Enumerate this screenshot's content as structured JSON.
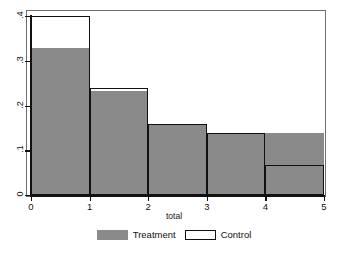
{
  "chart_data": {
    "type": "bar",
    "title": "",
    "subtitle": "",
    "xlabel": "total",
    "ylabel": "",
    "categories": [
      "0",
      "1",
      "2",
      "3",
      "4"
    ],
    "bin_edges": [
      0,
      1,
      2,
      3,
      4,
      5
    ],
    "xlim": [
      0,
      5
    ],
    "ylim": [
      0,
      0.4
    ],
    "grid": false,
    "legend_position": "bottom",
    "xticks": [
      "0",
      "1",
      "2",
      "3",
      "4",
      "5"
    ],
    "yticks": [
      "0",
      ".1",
      ".2",
      ".3",
      ".4"
    ],
    "ytick_values": [
      0,
      0.1,
      0.2,
      0.3,
      0.4
    ],
    "series": [
      {
        "name": "Treatment",
        "color": "#8a8a8a",
        "style": "filled",
        "values": [
          0.328,
          0.232,
          0.159,
          0.139,
          0.139
        ]
      },
      {
        "name": "Control",
        "color": "#111111",
        "style": "outline",
        "values": [
          0.4,
          0.239,
          0.159,
          0.139,
          0.067
        ]
      }
    ]
  },
  "axis": {
    "x_title": "total",
    "x_ticks": [
      "0",
      "1",
      "2",
      "3",
      "4",
      "5"
    ],
    "y_ticks": [
      ".4",
      ".3",
      ".2",
      ".1",
      "0"
    ]
  },
  "legend": {
    "items": [
      {
        "label": "Treatment",
        "swatch": "filled-gray-swatch"
      },
      {
        "label": "Control",
        "swatch": "outlined-white-swatch"
      }
    ]
  }
}
